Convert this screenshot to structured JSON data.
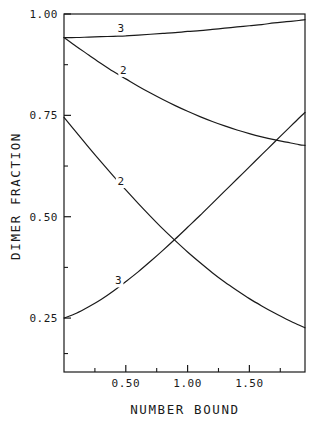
{
  "chart_data": {
    "type": "line",
    "title": "",
    "xlabel": "NUMBER BOUND",
    "ylabel": "DIMER FRACTION",
    "xlim": [
      0.0,
      1.95
    ],
    "ylim": [
      0.117,
      1.0
    ],
    "grid": false,
    "legend": "inline-curve-labels",
    "xticks": [
      0.5,
      1.0,
      1.5
    ],
    "xtick_labels": [
      "0.50",
      "1.00",
      "1.50"
    ],
    "x_minor_ticks": [
      0.25,
      0.75,
      1.25,
      1.75
    ],
    "yticks": [
      0.25,
      0.5,
      0.75,
      1.0
    ],
    "ytick_labels": [
      "0.25",
      "0.50",
      "0.75",
      "1.00"
    ],
    "y_minor_ticks": [
      0.1625,
      0.375,
      0.625,
      0.875
    ],
    "series": [
      {
        "name": "3",
        "label": "3",
        "label_x": 0.46,
        "label_y": 0.965,
        "description": "upper nearly-flat curve rising slightly toward 0.985",
        "x": [
          0.0,
          0.1,
          0.2,
          0.3,
          0.4,
          0.5,
          0.6,
          0.7,
          0.8,
          0.9,
          1.0,
          1.1,
          1.2,
          1.3,
          1.4,
          1.5,
          1.6,
          1.7,
          1.8,
          1.9,
          1.95
        ],
        "y": [
          0.942,
          0.942,
          0.943,
          0.944,
          0.945,
          0.946,
          0.948,
          0.95,
          0.952,
          0.954,
          0.957,
          0.959,
          0.962,
          0.965,
          0.968,
          0.971,
          0.974,
          0.978,
          0.981,
          0.984,
          0.986
        ]
      },
      {
        "name": "2-upper",
        "label": "2",
        "label_x": 0.48,
        "label_y": 0.862,
        "description": "upper decaying curve from 0.942 to 0.675",
        "x": [
          0.0,
          0.1,
          0.2,
          0.3,
          0.4,
          0.5,
          0.6,
          0.7,
          0.8,
          0.9,
          1.0,
          1.1,
          1.2,
          1.3,
          1.4,
          1.5,
          1.6,
          1.7,
          1.8,
          1.9,
          1.95
        ],
        "y": [
          0.942,
          0.92,
          0.899,
          0.878,
          0.858,
          0.84,
          0.822,
          0.805,
          0.789,
          0.774,
          0.76,
          0.747,
          0.735,
          0.724,
          0.714,
          0.705,
          0.697,
          0.69,
          0.684,
          0.678,
          0.676
        ]
      },
      {
        "name": "2-lower",
        "label": "2",
        "label_x": 0.46,
        "label_y": 0.588,
        "description": "lower decaying curve from 0.745 to 0.195",
        "x": [
          0.0,
          0.1,
          0.2,
          0.3,
          0.4,
          0.5,
          0.6,
          0.7,
          0.8,
          0.9,
          1.0,
          1.1,
          1.2,
          1.3,
          1.4,
          1.5,
          1.6,
          1.7,
          1.8,
          1.9,
          1.95
        ],
        "y": [
          0.745,
          0.708,
          0.671,
          0.635,
          0.6,
          0.566,
          0.533,
          0.501,
          0.47,
          0.441,
          0.413,
          0.387,
          0.362,
          0.339,
          0.318,
          0.298,
          0.28,
          0.263,
          0.247,
          0.233,
          0.226
        ]
      },
      {
        "name": "3-lower",
        "label": "3",
        "label_x": 0.44,
        "label_y": 0.343,
        "description": "rising curve from 0.25 to 0.755",
        "x": [
          0.0,
          0.1,
          0.2,
          0.3,
          0.4,
          0.5,
          0.6,
          0.7,
          0.8,
          0.9,
          1.0,
          1.1,
          1.2,
          1.3,
          1.4,
          1.5,
          1.6,
          1.7,
          1.8,
          1.9,
          1.95
        ],
        "y": [
          0.25,
          0.262,
          0.278,
          0.296,
          0.317,
          0.34,
          0.364,
          0.39,
          0.417,
          0.445,
          0.474,
          0.503,
          0.533,
          0.563,
          0.593,
          0.623,
          0.653,
          0.683,
          0.713,
          0.743,
          0.757
        ]
      }
    ]
  }
}
